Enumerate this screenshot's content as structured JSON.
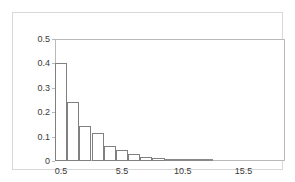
{
  "chart_data": {
    "type": "bar",
    "title": "",
    "subtitle": "",
    "xlabel": "",
    "ylabel": "",
    "categories": [
      "0.5",
      "1.5",
      "2.5",
      "3.5",
      "4.5",
      "5.5",
      "6.5",
      "7.5",
      "8.5",
      "9.5",
      "10.5",
      "11.5",
      "12.5"
    ],
    "values": [
      0.4,
      0.24,
      0.145,
      0.115,
      0.06,
      0.045,
      0.028,
      0.018,
      0.012,
      0.008,
      0.005,
      0.004,
      0.003
    ],
    "series": [
      {
        "name": "frequency",
        "values": [
          0.4,
          0.24,
          0.145,
          0.115,
          0.06,
          0.045,
          0.028,
          0.018,
          0.012,
          0.008,
          0.005,
          0.004,
          0.003
        ]
      }
    ],
    "bin_width": 1,
    "bin_starts": [
      0,
      1,
      2,
      3,
      4,
      5,
      6,
      7,
      8,
      9,
      10,
      11,
      12
    ],
    "xlim": [
      0,
      18.9
    ],
    "ylim": [
      0,
      0.5
    ],
    "xticks": [
      "0.5",
      "5.5",
      "10.5",
      "15.5"
    ],
    "xtick_values": [
      0.5,
      5.5,
      10.5,
      15.5
    ],
    "yticks": [
      "0",
      "0.1",
      "0.2",
      "0.3",
      "0.4",
      "0.5"
    ],
    "ytick_values": [
      0,
      0.1,
      0.2,
      0.3,
      0.4,
      0.5
    ],
    "grid": false,
    "legend": null,
    "legend_position": "none",
    "bar_fill_color": "#ffffff",
    "bar_edge_color": "#808080",
    "tail_bar_color": "#9a9a9a",
    "frame_color": "#b9b9b9",
    "panel_border_color": "#d8d8d8",
    "text_color": "#3a3a3a",
    "background_color": "#ffffff"
  },
  "figure": {
    "title_clipped": ""
  }
}
